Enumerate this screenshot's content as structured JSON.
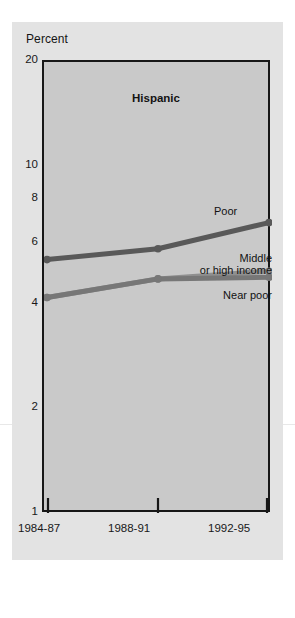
{
  "figure": {
    "axis_title": "Percent",
    "title": "Hispanic",
    "background_color": "#e3e3e3",
    "plot_color": "#c9c9c9"
  },
  "yticks": [
    {
      "label": "20",
      "value": 20
    },
    {
      "label": "10",
      "value": 10
    },
    {
      "label": "8",
      "value": 8
    },
    {
      "label": "6",
      "value": 6
    },
    {
      "label": "4",
      "value": 4
    },
    {
      "label": "2",
      "value": 2
    },
    {
      "label": "1",
      "value": 1
    }
  ],
  "xticks": [
    {
      "label": "1984-87"
    },
    {
      "label": "1988-91"
    },
    {
      "label": "1992-95"
    }
  ],
  "annotations": {
    "poor": "Poor",
    "middle_line1": "Middle",
    "middle_line2": "or high income",
    "near_poor": "Near poor"
  },
  "chart_data": {
    "type": "line",
    "title": "Hispanic",
    "xlabel": "",
    "ylabel": "Percent",
    "yscale": "log",
    "ylim": [
      1,
      20
    ],
    "yticks": [
      1,
      2,
      4,
      6,
      8,
      10,
      20
    ],
    "grid": false,
    "legend": "inline-annotations",
    "categories": [
      "1984-87",
      "1988-91",
      "1992-95"
    ],
    "series": [
      {
        "name": "Poor",
        "values": [
          5.4,
          5.8,
          6.9
        ],
        "color": "#595959",
        "marker": "circle",
        "label_position": "right-above-end"
      },
      {
        "name": "Middle or high income",
        "values": [
          4.2,
          4.75,
          5.0
        ],
        "color": "#8f8f8f",
        "marker": "circle",
        "label_position": "right-above-end"
      },
      {
        "name": "Near poor",
        "values": [
          4.2,
          4.75,
          4.8
        ],
        "color": "#777777",
        "marker": "circle",
        "label_position": "right-below-end"
      }
    ]
  }
}
